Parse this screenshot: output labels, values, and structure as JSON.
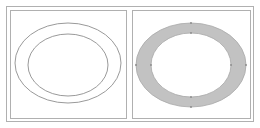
{
  "figure": {
    "panels": [
      {
        "name": "outline-annulus",
        "description": "Two concentric ellipses drawn as outlines"
      },
      {
        "name": "filled-annulus",
        "description": "Gray-filled ring between two concentric ellipses with control point markers"
      }
    ],
    "colors": {
      "stroke": "#9a9a9a",
      "fill": "#bdbdbd",
      "frame": "#a8a8a8"
    }
  }
}
